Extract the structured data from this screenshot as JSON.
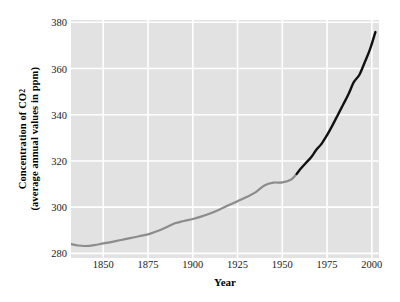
{
  "chart_data": {
    "type": "line",
    "title": "",
    "xlabel": "Year",
    "ylabel_line1": "Concentration of CO",
    "ylabel_sub": "2",
    "ylabel_line2": "(average annual values in ppm)",
    "xlim": [
      1832,
      2004
    ],
    "ylim": [
      278,
      381
    ],
    "xticks": [
      1850,
      1875,
      1900,
      1925,
      1950,
      1975,
      2000
    ],
    "xtick_labels": [
      "1850",
      "1875",
      "1900",
      "1925",
      "1950",
      "1975",
      "2000"
    ],
    "yticks": [
      280,
      300,
      320,
      340,
      360,
      380
    ],
    "ytick_labels": [
      "280",
      "300",
      "320",
      "340",
      "360",
      "380"
    ],
    "grid": true,
    "grid_color": "#ffffff",
    "plot_background": "#e2e2e2",
    "legend": null,
    "series": [
      {
        "name": "Ice core record",
        "color": "#8c8c8c",
        "x": [
          1832,
          1836,
          1840,
          1845,
          1850,
          1855,
          1860,
          1865,
          1870,
          1875,
          1880,
          1885,
          1890,
          1895,
          1900,
          1905,
          1910,
          1915,
          1920,
          1925,
          1930,
          1935,
          1940,
          1945,
          1950,
          1955,
          1958
        ],
        "values": [
          284.0,
          283.4,
          283.2,
          283.6,
          284.3,
          285.0,
          285.8,
          286.6,
          287.4,
          288.2,
          289.6,
          291.2,
          293.0,
          294.0,
          294.9,
          296.0,
          297.4,
          299.0,
          300.8,
          302.6,
          304.4,
          306.4,
          309.4,
          310.6,
          310.7,
          312.0,
          314.4
        ],
        "style": "solid",
        "width": 2.2
      },
      {
        "name": "Mauna Loa direct measurement",
        "color": "#111111",
        "x": [
          1958,
          1960,
          1963,
          1966,
          1969,
          1972,
          1975,
          1978,
          1981,
          1984,
          1987,
          1990,
          1993,
          1996,
          1999,
          2002
        ],
        "values": [
          314.4,
          316.4,
          319.0,
          321.5,
          324.8,
          327.5,
          331.2,
          335.4,
          339.9,
          344.4,
          349.0,
          354.2,
          357.2,
          362.6,
          368.4,
          375.8
        ],
        "style": "solid",
        "width": 2.4
      }
    ],
    "notes": {
      "start_value": "284",
      "end_value": "376",
      "transition_year": "1958"
    }
  },
  "axes": {
    "x_axis_title": "Year",
    "y_axis_title_line1": "Concentration of CO",
    "y_axis_title_line2": "(average annual values in ppm)"
  }
}
